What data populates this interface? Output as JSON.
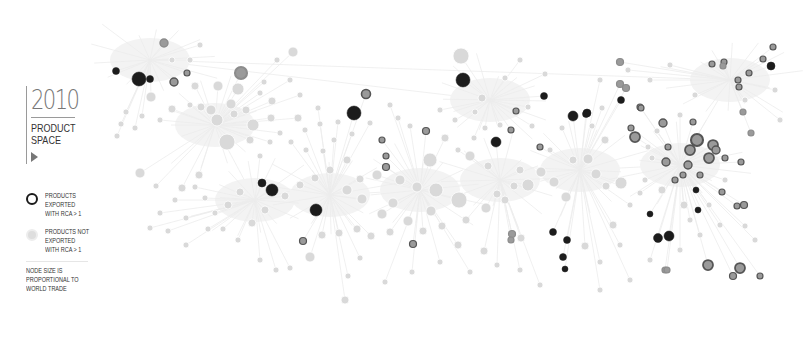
{
  "header": {
    "year": "2010",
    "title_line1": "PRODUCT",
    "title_line2": "SPACE"
  },
  "legend": {
    "exported": "PRODUCTS EXPORTED WITH RCA > 1",
    "not_exported": "PRODUCTS NOT EXPORTED WITH RCA > 1",
    "note": "NODE SIZE IS PROPORTIONAL TO WORLD TRADE"
  },
  "colors": {
    "background": "#ffffff",
    "edge": "#ececec",
    "node_not_exported": "#d9d9d9",
    "node_exported_dark": "#1c1c1c",
    "node_exported_mid": "#555555",
    "node_exported_light": "#8c8c8c",
    "text": "#333333",
    "year": "#777777"
  },
  "graph": {
    "hubs": [
      [
        215,
        125
      ],
      [
        255,
        200
      ],
      [
        330,
        195
      ],
      [
        420,
        190
      ],
      [
        500,
        180
      ],
      [
        580,
        170
      ],
      [
        680,
        165
      ],
      [
        730,
        80
      ],
      [
        150,
        60
      ],
      [
        490,
        100
      ]
    ],
    "exported_nodes": [
      [
        139,
        79,
        7,
        "d"
      ],
      [
        116,
        71,
        3.5,
        "d"
      ],
      [
        150,
        79,
        3.5,
        "d"
      ],
      [
        164,
        43,
        4,
        "l"
      ],
      [
        187,
        73,
        3,
        "m"
      ],
      [
        174,
        82,
        4,
        "m"
      ],
      [
        241,
        73,
        6,
        "l"
      ],
      [
        463,
        80,
        7,
        "d"
      ],
      [
        354,
        113,
        7,
        "d"
      ],
      [
        366,
        94,
        4.5,
        "m"
      ],
      [
        382,
        140,
        3,
        "m"
      ],
      [
        386,
        156,
        3,
        "m"
      ],
      [
        426,
        131,
        3.5,
        "m"
      ],
      [
        386,
        167,
        3.5,
        "m"
      ],
      [
        544,
        96,
        3.5,
        "d"
      ],
      [
        573,
        116,
        5,
        "d"
      ],
      [
        587,
        113,
        4,
        "d"
      ],
      [
        516,
        111,
        3,
        "m"
      ],
      [
        511,
        130,
        3,
        "m"
      ],
      [
        496,
        142,
        5,
        "d"
      ],
      [
        540,
        147,
        3,
        "m"
      ],
      [
        272,
        190,
        6,
        "d"
      ],
      [
        262,
        183,
        4,
        "d"
      ],
      [
        316,
        210,
        6,
        "d"
      ],
      [
        303,
        241,
        3.5,
        "m"
      ],
      [
        413,
        244,
        3.5,
        "m"
      ],
      [
        553,
        232,
        3.5,
        "d"
      ],
      [
        567,
        240,
        3.5,
        "d"
      ],
      [
        563,
        257,
        3.5,
        "d"
      ],
      [
        565,
        269,
        3,
        "d"
      ],
      [
        512,
        234,
        3.5,
        "l"
      ],
      [
        511,
        240,
        3,
        "l"
      ],
      [
        620,
        62,
        3.5,
        "l"
      ],
      [
        620,
        84,
        3.5,
        "l"
      ],
      [
        626,
        88,
        3.5,
        "l"
      ],
      [
        621,
        100,
        3.5,
        "d"
      ],
      [
        640,
        107,
        3,
        "m"
      ],
      [
        586,
        114,
        3.5,
        "d"
      ],
      [
        641,
        108,
        3,
        "m"
      ],
      [
        663,
        123,
        4,
        "m"
      ],
      [
        631,
        128,
        3,
        "m"
      ],
      [
        635,
        137,
        5,
        "m"
      ],
      [
        693,
        122,
        3,
        "m"
      ],
      [
        697,
        140,
        6,
        "m"
      ],
      [
        690,
        150,
        5,
        "m"
      ],
      [
        713,
        145,
        5,
        "m"
      ],
      [
        716,
        150,
        4,
        "m"
      ],
      [
        668,
        147,
        3,
        "m"
      ],
      [
        688,
        165,
        4,
        "m"
      ],
      [
        709,
        158,
        5,
        "m"
      ],
      [
        725,
        158,
        3,
        "m"
      ],
      [
        741,
        162,
        3,
        "m"
      ],
      [
        666,
        162,
        4,
        "m"
      ],
      [
        700,
        175,
        3,
        "m"
      ],
      [
        675,
        180,
        3,
        "m"
      ],
      [
        683,
        175,
        3,
        "m"
      ],
      [
        696,
        190,
        3,
        "d"
      ],
      [
        722,
        192,
        3,
        "m"
      ],
      [
        744,
        205,
        3.5,
        "m"
      ],
      [
        737,
        206,
        3,
        "m"
      ],
      [
        650,
        214,
        3,
        "d"
      ],
      [
        698,
        210,
        3,
        "d"
      ],
      [
        658,
        238,
        4.5,
        "d"
      ],
      [
        669,
        236,
        5,
        "d"
      ],
      [
        708,
        265,
        5,
        "m"
      ],
      [
        740,
        268,
        5,
        "m"
      ],
      [
        733,
        276,
        3.5,
        "m"
      ],
      [
        760,
        276,
        3,
        "m"
      ],
      [
        665,
        270,
        3,
        "l"
      ],
      [
        667,
        270,
        3,
        "l"
      ],
      [
        712,
        64,
        3,
        "m"
      ],
      [
        724,
        62,
        3,
        "m"
      ],
      [
        763,
        59,
        3,
        "m"
      ],
      [
        771,
        66,
        4,
        "d"
      ],
      [
        773,
        47,
        3,
        "m"
      ],
      [
        738,
        80,
        3,
        "m"
      ],
      [
        749,
        73,
        3,
        "m"
      ],
      [
        739,
        87,
        3,
        "m"
      ],
      [
        743,
        112,
        3,
        "l"
      ],
      [
        751,
        133,
        3,
        "l"
      ],
      [
        723,
        66,
        3,
        "l"
      ]
    ],
    "light_nodes": [
      [
        293,
        52,
        5
      ],
      [
        461,
        56,
        8
      ],
      [
        227,
        142,
        8
      ],
      [
        253,
        125,
        6
      ],
      [
        217,
        120,
        6
      ],
      [
        238,
        89,
        6
      ],
      [
        211,
        110,
        5
      ],
      [
        231,
        104,
        5
      ],
      [
        234,
        114,
        4
      ],
      [
        246,
        110,
        4
      ],
      [
        201,
        107,
        4
      ],
      [
        195,
        86,
        4
      ],
      [
        218,
        86,
        5
      ],
      [
        250,
        140,
        4
      ],
      [
        271,
        118,
        4
      ],
      [
        272,
        101,
        4
      ],
      [
        264,
        82,
        3
      ],
      [
        260,
        93,
        3
      ],
      [
        190,
        105,
        3
      ],
      [
        172,
        109,
        4
      ],
      [
        151,
        97,
        5
      ],
      [
        142,
        116,
        3
      ],
      [
        126,
        112,
        3
      ],
      [
        160,
        120,
        3
      ],
      [
        135,
        128,
        3
      ],
      [
        121,
        124,
        3
      ],
      [
        117,
        136,
        3
      ],
      [
        260,
        156,
        3
      ],
      [
        270,
        142,
        3
      ],
      [
        280,
        133,
        3
      ],
      [
        430,
        160,
        7
      ],
      [
        459,
        200,
        8
      ],
      [
        436,
        190,
        7
      ],
      [
        417,
        187,
        5
      ],
      [
        400,
        180,
        5
      ],
      [
        377,
        175,
        5
      ],
      [
        360,
        179,
        4
      ],
      [
        347,
        190,
        5
      ],
      [
        362,
        199,
        5
      ],
      [
        393,
        203,
        5
      ],
      [
        382,
        214,
        5
      ],
      [
        408,
        221,
        5
      ],
      [
        431,
        211,
        5
      ],
      [
        442,
        226,
        4
      ],
      [
        466,
        220,
        4
      ],
      [
        486,
        208,
        5
      ],
      [
        497,
        194,
        4
      ],
      [
        514,
        186,
        4
      ],
      [
        528,
        185,
        6
      ],
      [
        541,
        172,
        5
      ],
      [
        554,
        182,
        5
      ],
      [
        566,
        197,
        5
      ],
      [
        573,
        160,
        4
      ],
      [
        588,
        159,
        5
      ],
      [
        596,
        174,
        5
      ],
      [
        606,
        186,
        4
      ],
      [
        621,
        183,
        6
      ],
      [
        470,
        156,
        5
      ],
      [
        488,
        166,
        4
      ],
      [
        520,
        170,
        4
      ],
      [
        505,
        200,
        4
      ],
      [
        347,
        160,
        4
      ],
      [
        330,
        170,
        4
      ],
      [
        315,
        178,
        4
      ],
      [
        300,
        185,
        4
      ],
      [
        285,
        196,
        4
      ],
      [
        265,
        210,
        4
      ],
      [
        252,
        223,
        4
      ],
      [
        240,
        192,
        4
      ],
      [
        228,
        205,
        4
      ],
      [
        215,
        213,
        3
      ],
      [
        205,
        198,
        3
      ],
      [
        195,
        187,
        3
      ],
      [
        199,
        175,
        4
      ],
      [
        182,
        188,
        4
      ],
      [
        175,
        200,
        3
      ],
      [
        186,
        218,
        3
      ],
      [
        208,
        229,
        3
      ],
      [
        223,
        229,
        3
      ],
      [
        238,
        240,
        3
      ],
      [
        310,
        257,
        5
      ],
      [
        322,
        235,
        4
      ],
      [
        339,
        233,
        4
      ],
      [
        357,
        229,
        4
      ],
      [
        371,
        236,
        4
      ],
      [
        390,
        232,
        4
      ],
      [
        423,
        231,
        4
      ],
      [
        458,
        245,
        4
      ],
      [
        484,
        251,
        4
      ],
      [
        521,
        238,
        4
      ],
      [
        585,
        246,
        4
      ],
      [
        600,
        262,
        3
      ],
      [
        613,
        225,
        4
      ],
      [
        620,
        245,
        3
      ],
      [
        630,
        205,
        3
      ],
      [
        640,
        193,
        3
      ],
      [
        645,
        180,
        3
      ],
      [
        652,
        158,
        3
      ],
      [
        605,
        140,
        4
      ],
      [
        592,
        126,
        3
      ],
      [
        602,
        108,
        3
      ],
      [
        562,
        128,
        3
      ],
      [
        550,
        150,
        3
      ],
      [
        532,
        126,
        3
      ],
      [
        528,
        107,
        3
      ],
      [
        500,
        125,
        3
      ],
      [
        485,
        128,
        3
      ],
      [
        474,
        138,
        3
      ],
      [
        458,
        150,
        3
      ],
      [
        445,
        138,
        4
      ],
      [
        410,
        126,
        3
      ],
      [
        398,
        118,
        3
      ],
      [
        390,
        105,
        3
      ],
      [
        370,
        123,
        3
      ],
      [
        352,
        134,
        3
      ],
      [
        334,
        140,
        3
      ],
      [
        320,
        124,
        3
      ],
      [
        305,
        130,
        3
      ],
      [
        318,
        108,
        3
      ],
      [
        298,
        118,
        4
      ],
      [
        291,
        142,
        3
      ],
      [
        306,
        150,
        3
      ],
      [
        323,
        151,
        3
      ],
      [
        338,
        122,
        3
      ],
      [
        140,
        173,
        5
      ],
      [
        156,
        186,
        3
      ],
      [
        160,
        213,
        3
      ],
      [
        150,
        228,
        3
      ],
      [
        168,
        231,
        3
      ],
      [
        186,
        245,
        3
      ],
      [
        260,
        260,
        3
      ],
      [
        276,
        270,
        3
      ],
      [
        290,
        268,
        3
      ],
      [
        345,
        300,
        4
      ],
      [
        348,
        276,
        3
      ],
      [
        360,
        258,
        3
      ],
      [
        385,
        282,
        3
      ],
      [
        412,
        272,
        3
      ],
      [
        440,
        262,
        3
      ],
      [
        470,
        272,
        3
      ],
      [
        497,
        265,
        3
      ],
      [
        520,
        270,
        3
      ],
      [
        540,
        285,
        3
      ],
      [
        600,
        290,
        3
      ],
      [
        630,
        280,
        3
      ],
      [
        650,
        260,
        3
      ],
      [
        680,
        250,
        3
      ],
      [
        700,
        235,
        3
      ],
      [
        690,
        220,
        3
      ],
      [
        720,
        225,
        3
      ],
      [
        745,
        226,
        3
      ],
      [
        755,
        240,
        3
      ],
      [
        628,
        70,
        3
      ],
      [
        650,
        80,
        3
      ],
      [
        670,
        65,
        3
      ],
      [
        695,
        95,
        3
      ],
      [
        745,
        100,
        3
      ],
      [
        775,
        90,
        3
      ],
      [
        780,
        120,
        3
      ],
      [
        680,
        115,
        3
      ],
      [
        657,
        131,
        3
      ],
      [
        648,
        147,
        3
      ],
      [
        662,
        190,
        4
      ],
      [
        684,
        205,
        4
      ],
      [
        709,
        205,
        3
      ],
      [
        725,
        180,
        3
      ],
      [
        482,
        98,
        4
      ],
      [
        475,
        112,
        3
      ],
      [
        505,
        78,
        3
      ],
      [
        520,
        60,
        3
      ],
      [
        440,
        110,
        3
      ],
      [
        455,
        120,
        3
      ],
      [
        545,
        74,
        3
      ],
      [
        600,
        80,
        3
      ],
      [
        290,
        80,
        3
      ],
      [
        277,
        60,
        3
      ],
      [
        300,
        95,
        3
      ],
      [
        190,
        60,
        3
      ],
      [
        200,
        45,
        3
      ],
      [
        172,
        60,
        3
      ]
    ]
  }
}
